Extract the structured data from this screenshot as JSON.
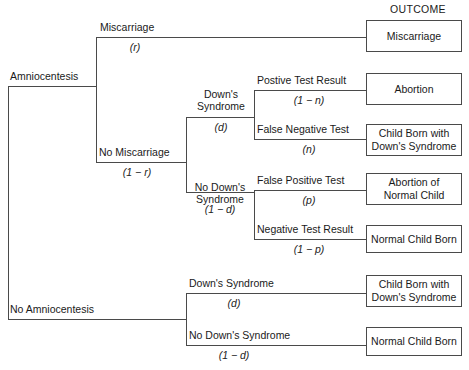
{
  "diagram": {
    "outcome_header": "OUTCOME",
    "root": {
      "branch_a_label": "Amniocentesis",
      "branch_b_label": "No Amniocentesis"
    },
    "level1": {
      "miscarriage_label": "Miscarriage",
      "miscarriage_prob": "(r)",
      "no_miscarriage_label": "No Miscarriage",
      "no_miscarriage_prob": "(1 − r)"
    },
    "level2_amnio": {
      "downs_label": "Down's\nSyndrome",
      "downs_prob": "(d)",
      "no_downs_label": "No Down's\nSyndrome",
      "no_downs_prob": "(1 − d)"
    },
    "level3_downs": {
      "positive_label": "Postive Test Result",
      "positive_prob": "(1 − n)",
      "false_negative_label": "False Negative Test",
      "false_negative_prob": "(n)"
    },
    "level3_no_downs": {
      "false_positive_label": "False Positive Test",
      "false_positive_prob": "(p)",
      "negative_label": "Negative Test Result",
      "negative_prob": "(1 − p)"
    },
    "level2_no_amnio": {
      "downs_label": "Down's Syndrome",
      "downs_prob": "(d)",
      "no_downs_label": "No Down's Syndrome",
      "no_downs_prob": "(1 − d)"
    },
    "outcomes": [
      {
        "id": "miscarriage",
        "text": "Miscarriage"
      },
      {
        "id": "abortion",
        "text": "Abortion"
      },
      {
        "id": "child-born-downs-amnio",
        "text": "Child Born with\nDown's Syndrome"
      },
      {
        "id": "abortion-normal-child",
        "text": "Abortion of\nNormal Child"
      },
      {
        "id": "normal-child-born-amnio",
        "text": "Normal Child Born"
      },
      {
        "id": "child-born-downs-no-amnio",
        "text": "Child Born with\nDown's Syndrome"
      },
      {
        "id": "normal-child-born-no-amnio",
        "text": "Normal Child Born"
      }
    ],
    "colors": {
      "line": "#4a4a4a",
      "text": "#1a1a1a",
      "background": "#ffffff"
    }
  }
}
